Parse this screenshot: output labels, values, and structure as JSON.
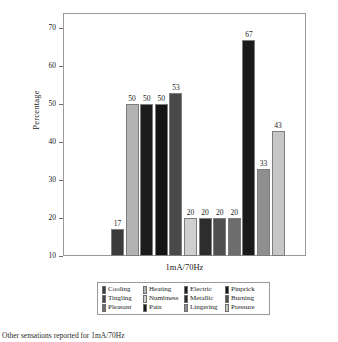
{
  "chart_data": {
    "type": "bar",
    "title": "",
    "xlabel": "1mA/70Hz",
    "ylabel": "Percentage",
    "ylim": [
      10,
      74
    ],
    "yticks": [
      10,
      20,
      30,
      40,
      50,
      60,
      70
    ],
    "grid": false,
    "legend_position": "below-axes",
    "categories": [
      "Cooling",
      "Heating",
      "Electric",
      "Pinprick",
      "Tingling",
      "Numbness",
      "Metallic",
      "Burning",
      "Pleasant",
      "Pain",
      "Lingering",
      "Pressure"
    ],
    "values": [
      17,
      50,
      50,
      50,
      53,
      20,
      20,
      20,
      20,
      67,
      33,
      43
    ],
    "value_labels": [
      "17",
      "50",
      "50",
      "50",
      "53",
      "20",
      "20",
      "20",
      "20",
      "67",
      "33",
      "43"
    ],
    "colors": [
      "#3b3b3b",
      "#b3b3b3",
      "#1c1c1c",
      "#141414",
      "#4a4a4a",
      "#cfcfcf",
      "#2d2d2d",
      "#4f4f4f",
      "#6d6d6d",
      "#1a1a1a",
      "#8f8f8f",
      "#c6c6c6"
    ]
  },
  "axes": {
    "y_title": "Percentage",
    "x_title": "1mA/70Hz",
    "y_tick_labels": [
      "70",
      "60",
      "50",
      "40",
      "30",
      "20",
      "10"
    ]
  },
  "legend": {
    "entries": [
      {
        "label": "Cooling",
        "color": "#3b3b3b"
      },
      {
        "label": "Heating",
        "color": "#b3b3b3"
      },
      {
        "label": "Electric",
        "color": "#1c1c1c"
      },
      {
        "label": "Pinprick",
        "color": "#141414"
      },
      {
        "label": "Tingling",
        "color": "#4a4a4a"
      },
      {
        "label": "Numbness",
        "color": "#cfcfcf"
      },
      {
        "label": "Metallic",
        "color": "#2d2d2d"
      },
      {
        "label": "Burning",
        "color": "#4f4f4f"
      },
      {
        "label": "Pleasant",
        "color": "#6d6d6d"
      },
      {
        "label": "Pain",
        "color": "#1a1a1a"
      },
      {
        "label": "Lingering",
        "color": "#8f8f8f"
      },
      {
        "label": "Pressure",
        "color": "#c6c6c6"
      }
    ]
  },
  "caption": {
    "text": "Other sensations reported for 1mA/70Hz"
  }
}
